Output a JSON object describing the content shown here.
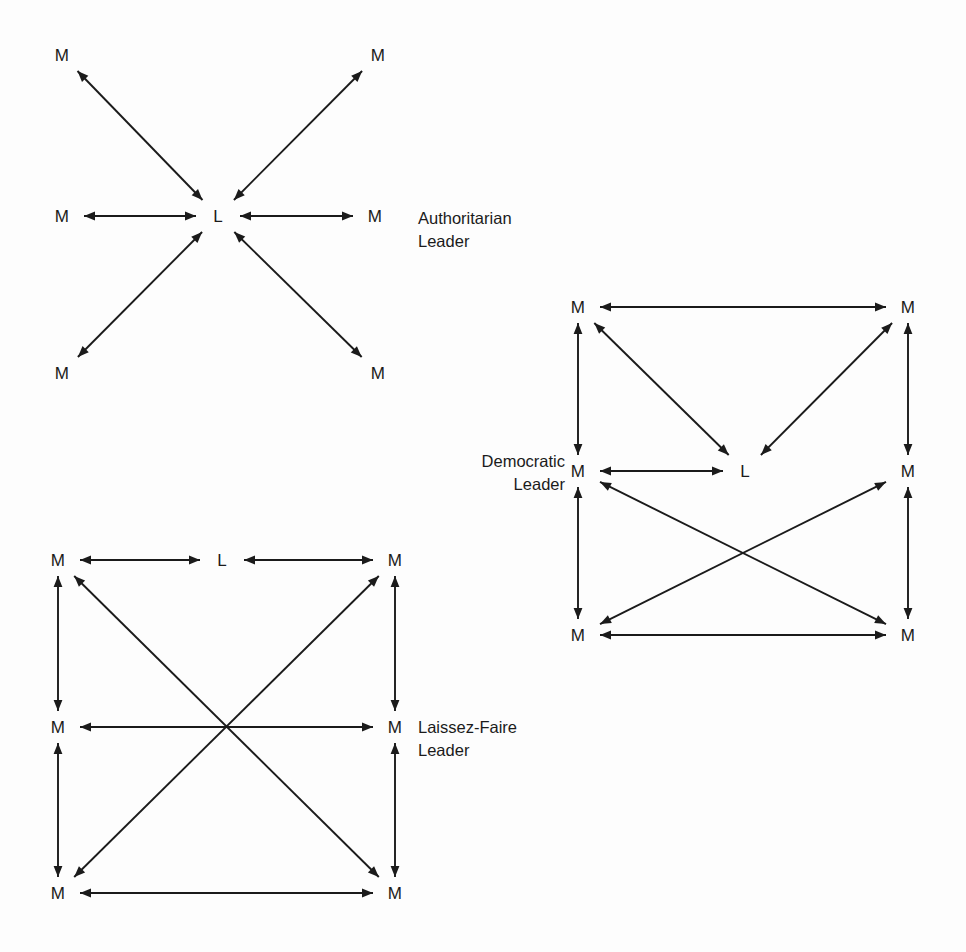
{
  "figure": {
    "background_color": "#fdfdfd",
    "line_color": "#1b1b1b",
    "node_member_label": "M",
    "node_leader_label": "L"
  },
  "diagrams": [
    {
      "id": "authoritarian",
      "caption_line1": "Authoritarian",
      "caption_line2": "Leader",
      "caption_align": "left",
      "caption_x": 418,
      "caption_y": 207,
      "nodes": [
        {
          "name": "member-top-left",
          "label": "M",
          "x": 62,
          "y": 55
        },
        {
          "name": "member-top-right",
          "label": "M",
          "x": 378,
          "y": 55
        },
        {
          "name": "member-middle-left",
          "label": "M",
          "x": 62,
          "y": 216
        },
        {
          "name": "leader-center",
          "label": "L",
          "x": 218,
          "y": 216
        },
        {
          "name": "member-middle-right",
          "label": "M",
          "x": 375,
          "y": 216
        },
        {
          "name": "member-bottom-left",
          "label": "M",
          "x": 62,
          "y": 373
        },
        {
          "name": "member-bottom-right",
          "label": "M",
          "x": 378,
          "y": 373
        }
      ],
      "edges": [
        {
          "name": "edge-leader-top-left",
          "from": "leader-center",
          "to": "member-top-left"
        },
        {
          "name": "edge-leader-top-right",
          "from": "leader-center",
          "to": "member-top-right"
        },
        {
          "name": "edge-leader-middle-left",
          "from": "leader-center",
          "to": "member-middle-left"
        },
        {
          "name": "edge-leader-middle-right",
          "from": "leader-center",
          "to": "member-middle-right"
        },
        {
          "name": "edge-leader-bottom-left",
          "from": "leader-center",
          "to": "member-bottom-left"
        },
        {
          "name": "edge-leader-bottom-right",
          "from": "leader-center",
          "to": "member-bottom-right"
        }
      ]
    },
    {
      "id": "democratic",
      "caption_line1": "Democratic",
      "caption_line2": "Leader",
      "caption_align": "right",
      "caption_x": 425,
      "caption_y": 450,
      "caption_width": 140,
      "nodes": [
        {
          "name": "member-top-left",
          "label": "M",
          "x": 578,
          "y": 307
        },
        {
          "name": "member-top-right",
          "label": "M",
          "x": 908,
          "y": 307
        },
        {
          "name": "member-middle-left",
          "label": "M",
          "x": 578,
          "y": 471
        },
        {
          "name": "leader-center",
          "label": "L",
          "x": 745,
          "y": 471
        },
        {
          "name": "member-middle-right",
          "label": "M",
          "x": 908,
          "y": 471
        },
        {
          "name": "member-bottom-left",
          "label": "M",
          "x": 578,
          "y": 635
        },
        {
          "name": "member-bottom-right",
          "label": "M",
          "x": 908,
          "y": 635
        }
      ],
      "edges": [
        {
          "name": "edge-top-left-to-top-right",
          "from": "member-top-left",
          "to": "member-top-right"
        },
        {
          "name": "edge-top-left-to-middle-left",
          "from": "member-top-left",
          "to": "member-middle-left"
        },
        {
          "name": "edge-top-right-to-middle-right",
          "from": "member-top-right",
          "to": "member-middle-right"
        },
        {
          "name": "edge-top-left-to-leader",
          "from": "member-top-left",
          "to": "leader-center"
        },
        {
          "name": "edge-top-right-to-leader",
          "from": "member-top-right",
          "to": "leader-center"
        },
        {
          "name": "edge-middle-left-to-leader",
          "from": "member-middle-left",
          "to": "leader-center"
        },
        {
          "name": "edge-middle-left-to-bottom-left",
          "from": "member-middle-left",
          "to": "member-bottom-left"
        },
        {
          "name": "edge-middle-right-to-bottom-right",
          "from": "member-middle-right",
          "to": "member-bottom-right"
        },
        {
          "name": "edge-middle-left-to-bottom-right",
          "from": "member-middle-left",
          "to": "member-bottom-right"
        },
        {
          "name": "edge-middle-right-to-bottom-left",
          "from": "member-middle-right",
          "to": "member-bottom-left"
        },
        {
          "name": "edge-bottom-left-to-bottom-right",
          "from": "member-bottom-left",
          "to": "member-bottom-right"
        }
      ]
    },
    {
      "id": "laissez-faire",
      "caption_line1": "Laissez-Faire",
      "caption_line2": "Leader",
      "caption_align": "left",
      "caption_x": 418,
      "caption_y": 716,
      "nodes": [
        {
          "name": "member-top-left",
          "label": "M",
          "x": 58,
          "y": 560
        },
        {
          "name": "leader-top-center",
          "label": "L",
          "x": 222,
          "y": 560
        },
        {
          "name": "member-top-right",
          "label": "M",
          "x": 395,
          "y": 560
        },
        {
          "name": "member-middle-left",
          "label": "M",
          "x": 58,
          "y": 727
        },
        {
          "name": "member-middle-right",
          "label": "M",
          "x": 395,
          "y": 727
        },
        {
          "name": "member-bottom-left",
          "label": "M",
          "x": 58,
          "y": 893
        },
        {
          "name": "member-bottom-right",
          "label": "M",
          "x": 395,
          "y": 893
        }
      ],
      "edges": [
        {
          "name": "edge-top-left-to-leader",
          "from": "member-top-left",
          "to": "leader-top-center"
        },
        {
          "name": "edge-leader-to-top-right",
          "from": "leader-top-center",
          "to": "member-top-right"
        },
        {
          "name": "edge-top-left-to-middle-left",
          "from": "member-top-left",
          "to": "member-middle-left"
        },
        {
          "name": "edge-top-right-to-middle-right",
          "from": "member-top-right",
          "to": "member-middle-right"
        },
        {
          "name": "edge-middle-left-to-middle-right",
          "from": "member-middle-left",
          "to": "member-middle-right"
        },
        {
          "name": "edge-middle-left-to-bottom-left",
          "from": "member-middle-left",
          "to": "member-bottom-left"
        },
        {
          "name": "edge-middle-right-to-bottom-right",
          "from": "member-middle-right",
          "to": "member-bottom-right"
        },
        {
          "name": "edge-top-left-to-bottom-right",
          "from": "member-top-left",
          "to": "member-bottom-right"
        },
        {
          "name": "edge-top-right-to-bottom-left",
          "from": "member-top-right",
          "to": "member-bottom-left"
        },
        {
          "name": "edge-bottom-left-to-bottom-right",
          "from": "member-bottom-left",
          "to": "member-bottom-right"
        }
      ]
    }
  ]
}
